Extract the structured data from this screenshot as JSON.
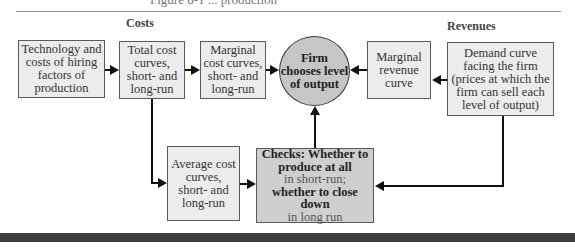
{
  "header": {
    "cut_title": "Figure 8-1 ... production"
  },
  "sections": {
    "costs_label": "Costs",
    "revenues_label": "Revenues"
  },
  "nodes": {
    "technology": "Technology and costs of hiring factors of production",
    "total_cost": "Total cost curves, short- and long-run",
    "marginal_cost": "Marginal cost curves, short- and long-run",
    "firm_chooses": "Firm chooses level of output",
    "marginal_revenue": "Marginal revenue curve",
    "demand_curve": "Demand curve facing the firm (prices at which the firm can sell each level of output)",
    "average_cost": "Average cost curves, short- and long-run",
    "checks": {
      "line1_bold": "Checks: Whether to produce at all",
      "line2": "in short-run;",
      "line3_bold": "whether to close down",
      "line4": "in long run"
    }
  },
  "colors": {
    "box_fill": "#ececec",
    "checks_fill": "#cfcfcf",
    "circle_fill": "#c6c6c6",
    "arrow": "#111111",
    "bottom_bar": "#3c3c3c"
  }
}
